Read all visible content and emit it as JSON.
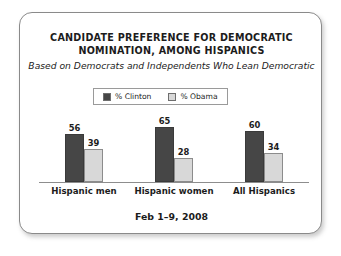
{
  "card": {
    "title_lines": [
      "CANDIDATE PREFERENCE FOR DEMOCRATIC",
      "NOMINATION, AMONG HISPANICS"
    ],
    "subtitle": "Based on Democrats and Independents Who Lean Democratic",
    "footer": "Feb 1–9, 2008"
  },
  "legend": {
    "items": [
      {
        "label": "% Clinton",
        "color": "#464646"
      },
      {
        "label": "% Obama",
        "color": "#d8d8d8"
      }
    ]
  },
  "chart_data": {
    "type": "bar",
    "title": "CANDIDATE PREFERENCE FOR DEMOCRATIC NOMINATION, AMONG HISPANICS",
    "subtitle": "Based on Democrats and Independents Who Lean Democratic",
    "note": "Feb 1–9, 2008",
    "categories": [
      "Hispanic men",
      "Hispanic women",
      "All Hispanics"
    ],
    "series": [
      {
        "name": "% Clinton",
        "color": "#464646",
        "values": [
          56,
          65,
          60
        ]
      },
      {
        "name": "% Obama",
        "color": "#d8d8d8",
        "values": [
          39,
          28,
          34
        ]
      }
    ],
    "xlabel": "",
    "ylabel": "",
    "ylim": [
      0,
      75
    ],
    "grid": false,
    "legend_position": "top-center",
    "value_labels": true
  }
}
